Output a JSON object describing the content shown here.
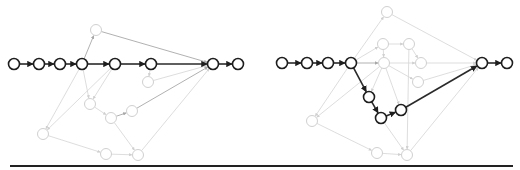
{
  "figure": {
    "node_radius": 5.5,
    "colors": {
      "bold": "#1e1e1e",
      "light": "#d0d0d0",
      "mid": "#a8a8a8",
      "baseline": "#222222"
    },
    "panels": [
      {
        "name": "left-graph",
        "nodes": [
          {
            "id": "L0",
            "x": 14,
            "y": 64,
            "style": "bold"
          },
          {
            "id": "L1",
            "x": 39,
            "y": 64,
            "style": "bold"
          },
          {
            "id": "L2",
            "x": 60,
            "y": 64,
            "style": "bold"
          },
          {
            "id": "L3",
            "x": 82,
            "y": 64,
            "style": "bold"
          },
          {
            "id": "L4",
            "x": 115,
            "y": 64,
            "style": "bold"
          },
          {
            "id": "L5",
            "x": 151,
            "y": 64,
            "style": "bold"
          },
          {
            "id": "L6",
            "x": 213,
            "y": 64,
            "style": "bold"
          },
          {
            "id": "L7",
            "x": 238,
            "y": 64,
            "style": "bold"
          },
          {
            "id": "LT",
            "x": 96,
            "y": 30,
            "style": "light"
          },
          {
            "id": "LA",
            "x": 148,
            "y": 82,
            "style": "light"
          },
          {
            "id": "LB",
            "x": 90,
            "y": 104,
            "style": "light"
          },
          {
            "id": "LC",
            "x": 111,
            "y": 118,
            "style": "light"
          },
          {
            "id": "LD",
            "x": 132,
            "y": 111,
            "style": "light"
          },
          {
            "id": "LE",
            "x": 43,
            "y": 134,
            "style": "light"
          },
          {
            "id": "LF",
            "x": 106,
            "y": 154,
            "style": "light"
          },
          {
            "id": "LG",
            "x": 138,
            "y": 155,
            "style": "light"
          }
        ],
        "edges": [
          {
            "from": "L0",
            "to": "L1",
            "style": "bold"
          },
          {
            "from": "L1",
            "to": "L2",
            "style": "bold"
          },
          {
            "from": "L2",
            "to": "L3",
            "style": "bold"
          },
          {
            "from": "L3",
            "to": "L4",
            "style": "bold"
          },
          {
            "from": "L4",
            "to": "L5",
            "style": "bold"
          },
          {
            "from": "L5",
            "to": "L6",
            "style": "bold"
          },
          {
            "from": "L6",
            "to": "L7",
            "style": "bold"
          },
          {
            "from": "L3",
            "to": "LT",
            "style": "mid"
          },
          {
            "from": "LT",
            "to": "L6",
            "style": "mid"
          },
          {
            "from": "L5",
            "to": "LA",
            "style": "light"
          },
          {
            "from": "LA",
            "to": "L6",
            "style": "light"
          },
          {
            "from": "L3",
            "to": "LB",
            "style": "light"
          },
          {
            "from": "L4",
            "to": "LB",
            "style": "light"
          },
          {
            "from": "LB",
            "to": "LC",
            "style": "light"
          },
          {
            "from": "LC",
            "to": "LD",
            "style": "mid"
          },
          {
            "from": "LD",
            "to": "L6",
            "style": "mid"
          },
          {
            "from": "L3",
            "to": "LE",
            "style": "light"
          },
          {
            "from": "L4",
            "to": "LE",
            "style": "light"
          },
          {
            "from": "LE",
            "to": "LF",
            "style": "light"
          },
          {
            "from": "LF",
            "to": "LG",
            "style": "light"
          },
          {
            "from": "LC",
            "to": "LG",
            "style": "light"
          },
          {
            "from": "LG",
            "to": "L6",
            "style": "light"
          }
        ]
      },
      {
        "name": "right-graph",
        "nodes": [
          {
            "id": "R0",
            "x": 282,
            "y": 63,
            "style": "bold"
          },
          {
            "id": "R1",
            "x": 307,
            "y": 63,
            "style": "bold"
          },
          {
            "id": "R2",
            "x": 328,
            "y": 63,
            "style": "bold"
          },
          {
            "id": "R3",
            "x": 351,
            "y": 63,
            "style": "bold"
          },
          {
            "id": "R4",
            "x": 369,
            "y": 97,
            "style": "bold"
          },
          {
            "id": "R5",
            "x": 381,
            "y": 118,
            "style": "bold"
          },
          {
            "id": "R6",
            "x": 401,
            "y": 110,
            "style": "bold"
          },
          {
            "id": "R7",
            "x": 482,
            "y": 63,
            "style": "bold"
          },
          {
            "id": "R8",
            "x": 507,
            "y": 63,
            "style": "bold"
          },
          {
            "id": "RT",
            "x": 387,
            "y": 12,
            "style": "light"
          },
          {
            "id": "RA",
            "x": 383,
            "y": 44,
            "style": "light"
          },
          {
            "id": "RB",
            "x": 409,
            "y": 44,
            "style": "light"
          },
          {
            "id": "RC",
            "x": 384,
            "y": 63,
            "style": "light"
          },
          {
            "id": "RD",
            "x": 421,
            "y": 63,
            "style": "light"
          },
          {
            "id": "RE",
            "x": 418,
            "y": 82,
            "style": "light"
          },
          {
            "id": "RF",
            "x": 312,
            "y": 121,
            "style": "light"
          },
          {
            "id": "RG",
            "x": 377,
            "y": 153,
            "style": "light"
          },
          {
            "id": "RH",
            "x": 407,
            "y": 155,
            "style": "light"
          }
        ],
        "edges": [
          {
            "from": "R0",
            "to": "R1",
            "style": "bold"
          },
          {
            "from": "R1",
            "to": "R2",
            "style": "bold"
          },
          {
            "from": "R2",
            "to": "R3",
            "style": "bold"
          },
          {
            "from": "R3",
            "to": "R4",
            "style": "bold"
          },
          {
            "from": "R4",
            "to": "R5",
            "style": "bold"
          },
          {
            "from": "R5",
            "to": "R6",
            "style": "bold"
          },
          {
            "from": "R6",
            "to": "R7",
            "style": "bold"
          },
          {
            "from": "R7",
            "to": "R8",
            "style": "bold"
          },
          {
            "from": "R3",
            "to": "RT",
            "style": "light"
          },
          {
            "from": "RT",
            "to": "R7",
            "style": "light"
          },
          {
            "from": "R3",
            "to": "RA",
            "style": "light"
          },
          {
            "from": "RA",
            "to": "RB",
            "style": "light"
          },
          {
            "from": "RB",
            "to": "RD",
            "style": "light"
          },
          {
            "from": "RA",
            "to": "RC",
            "style": "light"
          },
          {
            "from": "R3",
            "to": "RC",
            "style": "mid"
          },
          {
            "from": "RC",
            "to": "RD",
            "style": "light"
          },
          {
            "from": "RD",
            "to": "R7",
            "style": "light"
          },
          {
            "from": "RC",
            "to": "RE",
            "style": "light"
          },
          {
            "from": "RE",
            "to": "R7",
            "style": "light"
          },
          {
            "from": "RC",
            "to": "R4",
            "style": "light"
          },
          {
            "from": "RC",
            "to": "R6",
            "style": "light"
          },
          {
            "from": "RB",
            "to": "RH",
            "style": "light"
          },
          {
            "from": "R3",
            "to": "RF",
            "style": "light"
          },
          {
            "from": "RC",
            "to": "RF",
            "style": "light"
          },
          {
            "from": "RF",
            "to": "RG",
            "style": "light"
          },
          {
            "from": "RG",
            "to": "RH",
            "style": "light"
          },
          {
            "from": "R5",
            "to": "RH",
            "style": "light"
          },
          {
            "from": "RH",
            "to": "R7",
            "style": "light"
          }
        ]
      }
    ],
    "baseline": {
      "x1": 10,
      "x2": 513,
      "y": 166
    }
  }
}
